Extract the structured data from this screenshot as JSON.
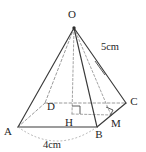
{
  "figure": {
    "type": "geometry-diagram",
    "shape": "square-based-pyramid",
    "title": "",
    "vertices": [
      {
        "id": "O",
        "label": "O",
        "role": "apex",
        "x": 74,
        "y": 28,
        "label_x": 72,
        "label_y": 18
      },
      {
        "id": "A",
        "label": "A",
        "role": "base-corner",
        "x": 18,
        "y": 127,
        "label_x": 8,
        "label_y": 135
      },
      {
        "id": "B",
        "label": "B",
        "role": "base-corner",
        "x": 97,
        "y": 127,
        "label_x": 99,
        "label_y": 138
      },
      {
        "id": "C",
        "label": "C",
        "role": "base-corner",
        "x": 126,
        "y": 103,
        "label_x": 131,
        "label_y": 104
      },
      {
        "id": "D",
        "label": "D",
        "role": "base-corner-hidden",
        "x": 45,
        "y": 103,
        "label_x": 50,
        "label_y": 110
      },
      {
        "id": "H",
        "label": "H",
        "role": "base-center",
        "x": 72,
        "y": 114,
        "label_x": 68,
        "label_y": 125
      },
      {
        "id": "M",
        "label": "M",
        "role": "edge-midpoint",
        "x": 111,
        "y": 115,
        "label_x": 114,
        "label_y": 126
      }
    ],
    "edges": [
      {
        "from": "O",
        "to": "A",
        "style": "solid",
        "name": "edge-OA"
      },
      {
        "from": "O",
        "to": "B",
        "style": "solid",
        "name": "edge-OB"
      },
      {
        "from": "O",
        "to": "C",
        "style": "solid",
        "name": "edge-OC"
      },
      {
        "from": "O",
        "to": "D",
        "style": "hidden",
        "name": "edge-OD"
      },
      {
        "from": "A",
        "to": "B",
        "style": "solid",
        "name": "edge-AB"
      },
      {
        "from": "B",
        "to": "C",
        "style": "solid",
        "name": "edge-BC"
      },
      {
        "from": "C",
        "to": "D",
        "style": "hidden",
        "name": "edge-CD"
      },
      {
        "from": "D",
        "to": "A",
        "style": "hidden",
        "name": "edge-DA"
      },
      {
        "from": "O",
        "to": "H",
        "style": "axis",
        "name": "altitude-OH"
      },
      {
        "from": "O",
        "to": "M",
        "style": "axis",
        "name": "slant-OM"
      },
      {
        "from": "H",
        "to": "M",
        "style": "axis",
        "name": "apothem-HM"
      },
      {
        "from": "D",
        "to": "C",
        "style": "axis",
        "name": "midline-DC"
      }
    ],
    "measurements": [
      {
        "id": "slant",
        "label": "5cm",
        "x": 98,
        "y": 47,
        "applies_to": "edge-OC",
        "tick": true
      },
      {
        "id": "base",
        "label": "4cm",
        "x": 47,
        "y": 146,
        "applies_to": "edge-AB",
        "arc": true
      }
    ],
    "right_angles": [
      {
        "id": "angle-at-H",
        "at": "H",
        "name": "right-angle-H"
      },
      {
        "id": "angle-at-M",
        "at": "M",
        "name": "right-angle-M"
      }
    ],
    "colors": {
      "background": "#ffffff",
      "solid_edge": "#3a3a3a",
      "hidden_edge": "#8f8f8f",
      "label_text": "#262626",
      "dimension_arc": "#a8a8a8"
    }
  }
}
